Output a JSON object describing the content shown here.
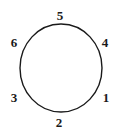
{
  "diagram": {
    "type": "circle-with-numbered-points",
    "stroke_color": "#1a1a1a",
    "label_color": "#1a1a1a",
    "circle": {
      "cx": 61,
      "cy": 68,
      "rx": 41,
      "ry": 44
    },
    "labels": [
      {
        "id": "5",
        "text": "5",
        "x": 54,
        "y": 9
      },
      {
        "id": "4",
        "text": "4",
        "x": 99,
        "y": 36
      },
      {
        "id": "6",
        "text": "6",
        "x": 8,
        "y": 36
      },
      {
        "id": "3",
        "text": "3",
        "x": 8,
        "y": 91
      },
      {
        "id": "1",
        "text": "1",
        "x": 100,
        "y": 91
      },
      {
        "id": "2",
        "text": "2",
        "x": 53,
        "y": 116
      }
    ]
  }
}
